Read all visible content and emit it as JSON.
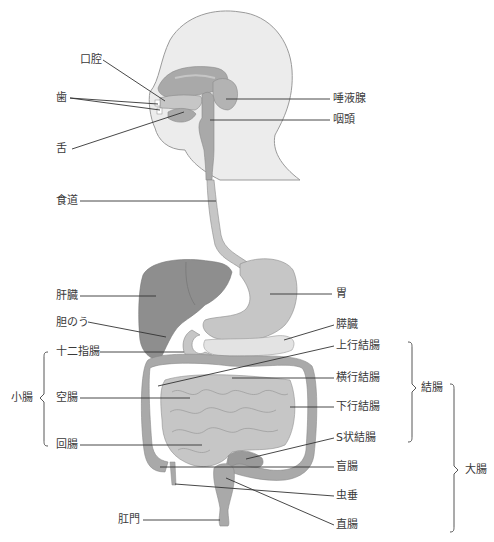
{
  "colors": {
    "head_fill": "#ececec",
    "head_stroke": "#9a9a9a",
    "organ_dark": "#8e8e8e",
    "organ_mid": "#a9a9a9",
    "organ_light": "#c6c6c6",
    "organ_lighter": "#d9d9d9",
    "line": "#333333"
  },
  "labels": {
    "left": {
      "koukuu": "口腔",
      "ha": "歯",
      "shita": "舌",
      "shokudou": "食道",
      "kanzou": "肝臓",
      "tannou": "胆のう",
      "juunishichou": "十二指腸",
      "kuuchou": "空腸",
      "kaichou": "回腸",
      "koumon": "肛門"
    },
    "right": {
      "daekisen": "唾液腺",
      "intou": "咽頭",
      "i": "胃",
      "suizou": "膵臓",
      "joukou_ketchou": "上行結腸",
      "oukou_ketchou": "横行結腸",
      "kakou_ketchou": "下行結腸",
      "s_joukou_ketchou": "S状結腸",
      "mouchou": "盲腸",
      "chuusui": "虫垂",
      "chokuchou": "直腸"
    },
    "groups": {
      "shouchou": "小腸",
      "ketchou": "結腸",
      "daichou": "大腸"
    }
  }
}
